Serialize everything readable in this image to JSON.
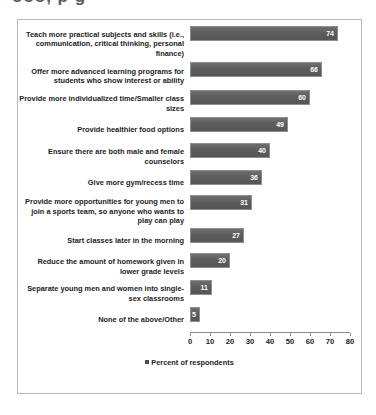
{
  "title_bleed": "ooo, p g",
  "chart_data": {
    "type": "bar",
    "orientation": "horizontal",
    "title": "",
    "xlabel": "",
    "ylabel": "",
    "xlim": [
      0,
      80
    ],
    "xticks": [
      0,
      10,
      20,
      30,
      40,
      50,
      60,
      70,
      80
    ],
    "grid": false,
    "legend_position": "bottom",
    "legend": [
      "Percent of respondents"
    ],
    "bar_color": "#5d5d5d",
    "categories": [
      "Teach more practical subjects and skills (i.e., communication, critical thinking, personal finance)",
      "Offer more advanced learning programs for students who show interest or ability",
      "Provide more individualized time/Smaller class sizes",
      "Provide healthier food options",
      "Ensure there are both male and female counselors",
      "Give more gym/recess time",
      "Provide more opportunities for young men to join a sports team, so anyone who wants to play can play",
      "Start classes later in the morning",
      "Reduce the amount of homework given in lower grade levels",
      "Separate young men and women into single-sex classrooms",
      "None of the above/Other"
    ],
    "values": [
      74,
      66,
      60,
      49,
      40,
      36,
      31,
      27,
      20,
      11,
      5
    ],
    "series": [
      {
        "name": "Percent of respondents",
        "values": [
          74,
          66,
          60,
          49,
          40,
          36,
          31,
          27,
          20,
          11,
          5
        ]
      }
    ]
  }
}
